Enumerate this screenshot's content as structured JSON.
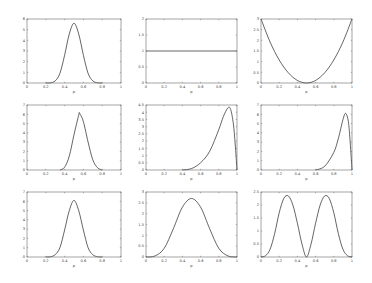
{
  "figure": {
    "width": 372,
    "height": 283,
    "background": "#ffffff",
    "line_color": "#222222"
  },
  "chart_data": [
    {
      "type": "line",
      "panel": "1",
      "xlabel": "p",
      "ylabel": "",
      "xlim": [
        0,
        1
      ],
      "ylim": [
        0,
        6
      ],
      "xticks": [
        "0",
        "0.2",
        "0.4",
        "0.6",
        "0.8",
        "1"
      ],
      "yticks": [
        "0",
        "1",
        "2",
        "3",
        "4",
        "5",
        "6"
      ],
      "x": [
        0.2,
        0.25,
        0.3,
        0.35,
        0.4,
        0.45,
        0.5,
        0.55,
        0.6,
        0.65,
        0.7,
        0.75,
        0.8
      ],
      "y": [
        0,
        0.02,
        0.2,
        0.9,
        2.6,
        4.6,
        5.6,
        4.6,
        2.6,
        0.9,
        0.2,
        0.02,
        0
      ]
    },
    {
      "type": "line",
      "panel": "2",
      "xlabel": "p",
      "ylabel": "",
      "xlim": [
        0,
        1
      ],
      "ylim": [
        0,
        2
      ],
      "xticks": [
        "0",
        "0.2",
        "0.4",
        "0.6",
        "0.8",
        "1"
      ],
      "yticks": [
        "0",
        "0.5",
        "1",
        "1.5",
        "2"
      ],
      "x": [
        0,
        1
      ],
      "y": [
        1,
        1
      ]
    },
    {
      "type": "line",
      "panel": "3",
      "xlabel": "p",
      "ylabel": "",
      "xlim": [
        0,
        1
      ],
      "ylim": [
        0,
        3
      ],
      "xticks": [
        "0",
        "0.2",
        "0.4",
        "0.6",
        "0.8",
        "1"
      ],
      "yticks": [
        "0",
        "0.5",
        "1",
        "1.5",
        "2",
        "2.5",
        "3"
      ],
      "x": [
        0,
        0.1,
        0.2,
        0.3,
        0.4,
        0.5,
        0.6,
        0.7,
        0.8,
        0.9,
        1
      ],
      "y": [
        3,
        1.92,
        1.08,
        0.48,
        0.12,
        0,
        0.12,
        0.48,
        1.08,
        1.92,
        3
      ]
    },
    {
      "type": "line",
      "panel": "4",
      "xlabel": "p",
      "ylabel": "",
      "xlim": [
        0,
        1
      ],
      "ylim": [
        0,
        7
      ],
      "xticks": [
        "0",
        "0.2",
        "0.4",
        "0.6",
        "0.8",
        "1"
      ],
      "yticks": [
        "0",
        "1",
        "2",
        "3",
        "4",
        "5",
        "6",
        "7"
      ],
      "x": [
        0.35,
        0.4,
        0.45,
        0.5,
        0.55,
        0.56,
        0.6,
        0.65,
        0.7,
        0.75,
        0.8
      ],
      "y": [
        0,
        0.3,
        1.5,
        3.8,
        5.9,
        6.1,
        5.2,
        3.0,
        1.1,
        0.25,
        0
      ]
    },
    {
      "type": "line",
      "panel": "5",
      "xlabel": "p",
      "ylabel": "",
      "xlim": [
        0,
        1
      ],
      "ylim": [
        0,
        4.5
      ],
      "xticks": [
        "0",
        "0.2",
        "0.4",
        "0.6",
        "0.8",
        "1"
      ],
      "yticks": [
        "0",
        "0.5",
        "1",
        "1.5",
        "2",
        "2.5",
        "3",
        "3.5",
        "4",
        "4.5"
      ],
      "x": [
        0.4,
        0.5,
        0.6,
        0.7,
        0.8,
        0.85,
        0.9,
        0.93,
        0.96,
        0.98,
        1
      ],
      "y": [
        0,
        0.1,
        0.5,
        1.3,
        2.8,
        3.7,
        4.3,
        4.2,
        3.2,
        1.8,
        0
      ]
    },
    {
      "type": "line",
      "panel": "6",
      "xlabel": "p",
      "ylabel": "",
      "xlim": [
        0,
        1
      ],
      "ylim": [
        0,
        7
      ],
      "xticks": [
        "0",
        "0.2",
        "0.4",
        "0.6",
        "0.8",
        "1"
      ],
      "yticks": [
        "0",
        "1",
        "2",
        "3",
        "4",
        "5",
        "6",
        "7"
      ],
      "x": [
        0.6,
        0.7,
        0.8,
        0.85,
        0.9,
        0.93,
        0.96,
        0.98,
        1
      ],
      "y": [
        0,
        0.4,
        1.9,
        3.4,
        5.4,
        6.1,
        5.2,
        3.0,
        0
      ]
    },
    {
      "type": "line",
      "panel": "7",
      "xlabel": "p",
      "ylabel": "",
      "xlim": [
        0,
        1
      ],
      "ylim": [
        0,
        7
      ],
      "xticks": [
        "0",
        "0.2",
        "0.4",
        "0.6",
        "0.8",
        "1"
      ],
      "yticks": [
        "0",
        "1",
        "2",
        "3",
        "4",
        "5",
        "6",
        "7"
      ],
      "x": [
        0.2,
        0.25,
        0.3,
        0.35,
        0.4,
        0.45,
        0.5,
        0.55,
        0.6,
        0.65,
        0.7,
        0.75,
        0.8
      ],
      "y": [
        0,
        0.03,
        0.25,
        1.0,
        2.9,
        5.0,
        6.1,
        5.0,
        2.9,
        1.0,
        0.25,
        0.03,
        0
      ]
    },
    {
      "type": "line",
      "panel": "8",
      "xlabel": "p",
      "ylabel": "",
      "xlim": [
        0,
        1
      ],
      "ylim": [
        0,
        3
      ],
      "xticks": [
        "0",
        "0.2",
        "0.4",
        "0.6",
        "0.8",
        "1"
      ],
      "yticks": [
        "0",
        "0.5",
        "1",
        "1.5",
        "2",
        "2.5",
        "3"
      ],
      "x": [
        0,
        0.1,
        0.2,
        0.3,
        0.4,
        0.5,
        0.6,
        0.7,
        0.8,
        0.9,
        1
      ],
      "y": [
        0,
        0.05,
        0.4,
        1.3,
        2.3,
        2.7,
        2.3,
        1.3,
        0.4,
        0.05,
        0
      ]
    },
    {
      "type": "line",
      "panel": "9",
      "xlabel": "p",
      "ylabel": "",
      "xlim": [
        0,
        1
      ],
      "ylim": [
        0,
        2.5
      ],
      "xticks": [
        "0",
        "0.2",
        "0.4",
        "0.6",
        "0.8",
        "1"
      ],
      "yticks": [
        "0",
        "0.5",
        "1",
        "1.5",
        "2",
        "2.5"
      ],
      "x": [
        0,
        0.05,
        0.1,
        0.15,
        0.2,
        0.25,
        0.3,
        0.35,
        0.4,
        0.45,
        0.5,
        0.55,
        0.6,
        0.65,
        0.7,
        0.75,
        0.8,
        0.85,
        0.9,
        0.95,
        1
      ],
      "y": [
        0,
        0.05,
        0.3,
        0.9,
        1.7,
        2.25,
        2.35,
        2.0,
        1.3,
        0.5,
        0,
        0.5,
        1.3,
        2.0,
        2.35,
        2.25,
        1.7,
        0.9,
        0.3,
        0.05,
        0
      ]
    }
  ],
  "panels_layout": {
    "cols": [
      [
        27,
        121
      ],
      [
        146,
        237
      ],
      [
        261,
        352
      ]
    ],
    "rows": [
      [
        19,
        83
      ],
      [
        105,
        170
      ],
      [
        192,
        257
      ]
    ]
  }
}
